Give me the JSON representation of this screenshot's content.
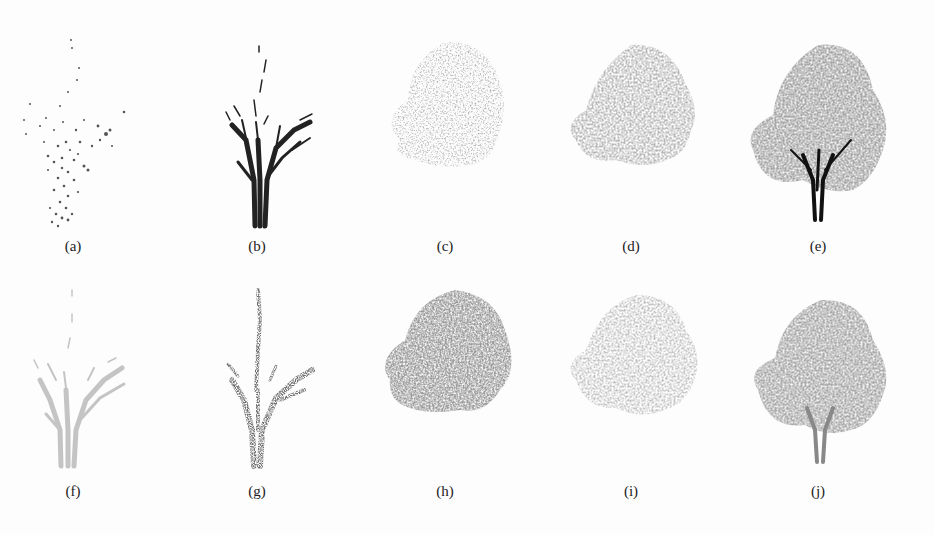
{
  "figure": {
    "rows": [
      {
        "panels": [
          {
            "label": "(a)",
            "kind": "branch-points",
            "tone": "#555555"
          },
          {
            "label": "(b)",
            "kind": "skeleton",
            "tone": "#222222"
          },
          {
            "label": "(c)",
            "kind": "sparse-foliage",
            "tone": "#9a9a9a"
          },
          {
            "label": "(d)",
            "kind": "foliage",
            "tone": "#8c8c8c"
          },
          {
            "label": "(e)",
            "kind": "full-tree",
            "tone": "#6f6f6f"
          }
        ]
      },
      {
        "panels": [
          {
            "label": "(f)",
            "kind": "skeleton",
            "tone": "#c4c4c4"
          },
          {
            "label": "(g)",
            "kind": "branch-points",
            "tone": "#333333"
          },
          {
            "label": "(h)",
            "kind": "dense-foliage",
            "tone": "#7a7a7a"
          },
          {
            "label": "(i)",
            "kind": "foliage",
            "tone": "#a0a0a0"
          },
          {
            "label": "(j)",
            "kind": "full-tree-light",
            "tone": "#8a8a8a"
          }
        ]
      }
    ]
  }
}
